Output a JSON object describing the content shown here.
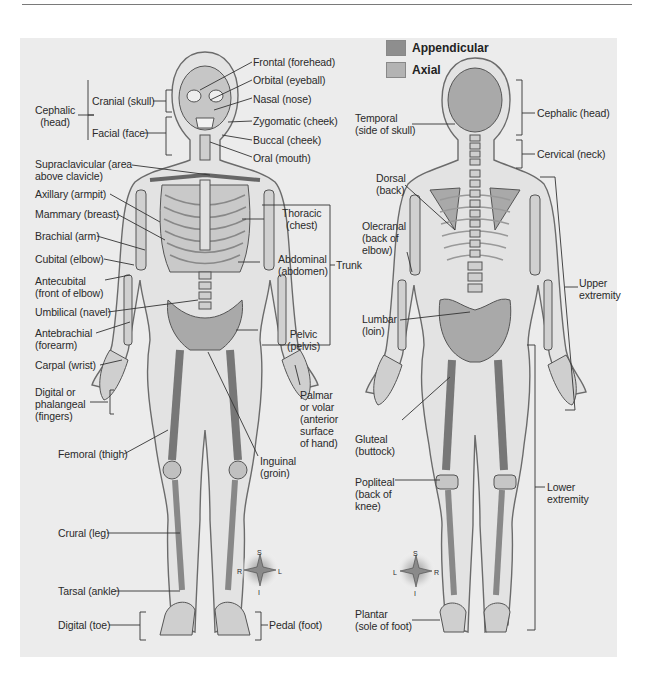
{
  "legend": [
    {
      "label": "Appendicular",
      "color": "#8e8e8e"
    },
    {
      "label": "Axial",
      "color": "#b3b3b3"
    }
  ],
  "anterior_view": {
    "labels": {
      "frontal": "Frontal (forehead)",
      "orbital": "Orbital (eyeball)",
      "nasal": "Nasal (nose)",
      "zygomatic": "Zygomatic (cheek)",
      "buccal": "Buccal (cheek)",
      "oral": "Oral (mouth)",
      "cephalic": "Cephalic\n(head)",
      "cranial": "Cranial (skull)",
      "facial": "Facial (face)",
      "supraclavicular": "Supraclavicular (area\nabove clavicle)",
      "axillary": "Axillary (armpit)",
      "mammary": "Mammary (breast)",
      "brachial": "Brachial (arm)",
      "cubital": "Cubital (elbow)",
      "antecubital": "Antecubital\n(front of elbow)",
      "umbilical": "Umbilical (navel)",
      "antebrachial": "Antebrachial\n(forearm)",
      "carpal": "Carpal (wrist)",
      "digital_fingers": "Digital or\nphalangeal\n(fingers)",
      "femoral": "Femoral (thigh)",
      "crural": "Crural (leg)",
      "tarsal": "Tarsal (ankle)",
      "digital_toe": "Digital (toe)",
      "thoracic": "Thoracic\n(chest)",
      "abdominal": "Abdominal\n(abdomen)",
      "pelvic": "Pelvic\n(pelvis)",
      "trunk": "Trunk",
      "palmar": "Palmar\nor volar\n(anterior\nsurface\nof hand)",
      "inguinal": "Inguinal\n(groin)",
      "pedal": "Pedal (foot)"
    },
    "compass": {
      "top": "S",
      "left": "R",
      "right": "L",
      "bottom": "I"
    }
  },
  "posterior_view": {
    "labels": {
      "temporal": "Temporal\n(side of skull)",
      "cephalic_head": "Cephalic (head)",
      "cervical": "Cervical (neck)",
      "dorsal": "Dorsal\n(back)",
      "olecranal": "Olecranal\n(back of\nelbow)",
      "upper_extremity": "Upper\nextremity",
      "lumbar": "Lumbar\n(loin)",
      "gluteal": "Gluteal\n(buttock)",
      "popliteal": "Popliteal\n(back of\nknee)",
      "lower_extremity": "Lower\nextremity",
      "plantar": "Plantar\n(sole of foot)"
    },
    "compass": {
      "top": "S",
      "left": "L",
      "right": "R",
      "bottom": "I"
    }
  }
}
